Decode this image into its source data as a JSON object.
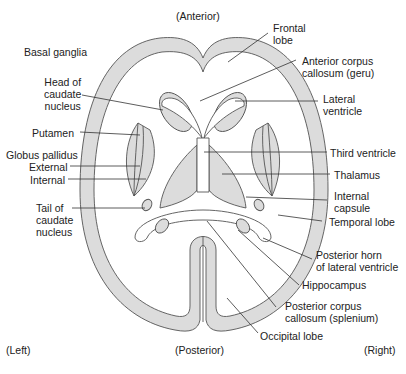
{
  "orientation": {
    "top": "(Anterior)",
    "bottom": "(Posterior)",
    "left": "(Left)",
    "right": "(Right)"
  },
  "group_heading": "Basal ganglia",
  "labels_left": {
    "head_caudate": [
      "Head of",
      "caudate",
      "nucleus"
    ],
    "putamen": "Putamen",
    "globus_pallidus": "Globus pallidus",
    "external": "External",
    "internal": "Internal",
    "tail_caudate": [
      "Tail of",
      "caudate",
      "nucleus"
    ]
  },
  "labels_right": {
    "frontal_lobe": [
      "Frontal",
      "lobe"
    ],
    "anterior_cc": [
      "Anterior corpus",
      "callosum (geru)"
    ],
    "lateral_ventricle": [
      "Lateral",
      "ventricle"
    ],
    "third_ventricle": "Third ventricle",
    "thalamus": "Thalamus",
    "internal_capsule": [
      "Internal",
      "capsule"
    ],
    "temporal_lobe": "Temporal lobe",
    "posterior_horn": [
      "Posterior horn",
      "of lateral ventricle"
    ],
    "hippocampus": "Hippocampus",
    "posterior_cc": [
      "Posterior corpus",
      "callosum (splenium)"
    ],
    "occipital_lobe": "Occipital lobe"
  },
  "colors": {
    "fill": "#dcdcdc",
    "stroke": "#555555",
    "text": "#222222",
    "background": "#ffffff"
  }
}
